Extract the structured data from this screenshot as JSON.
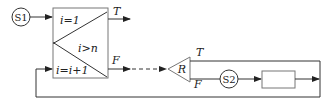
{
  "diagram": {
    "start_node": {
      "label": "S1"
    },
    "loop_box": {
      "init": "i=1",
      "condition": "i>n",
      "increment": "i=i+1"
    },
    "outputs": {
      "true_label": "T",
      "false_label": "F"
    },
    "decision": {
      "label": "R",
      "true_label": "T",
      "false_label": "F"
    },
    "second_node": {
      "label": "S2"
    },
    "process_box": {
      "label": ""
    },
    "colors": {
      "line": "#333333",
      "box_border": "#777777",
      "background": "#ffffff"
    }
  }
}
